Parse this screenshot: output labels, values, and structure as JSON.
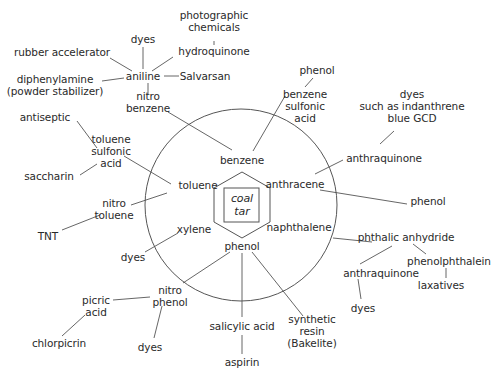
{
  "diagram": {
    "center": {
      "label": "coal\ntar",
      "x": 242,
      "y": 205
    },
    "colors": {
      "line": "#555555",
      "text": "#2a2a2a",
      "background": "#ffffff"
    },
    "nodes": [
      {
        "id": "benzene",
        "label": "benzene",
        "x": 242,
        "y": 160
      },
      {
        "id": "toluene",
        "label": "toluene",
        "x": 198,
        "y": 185
      },
      {
        "id": "anthracene",
        "label": "anthracene",
        "x": 295,
        "y": 184
      },
      {
        "id": "xylene",
        "label": "xylene",
        "x": 194,
        "y": 229
      },
      {
        "id": "naphthalene",
        "label": "naphthalene",
        "x": 299,
        "y": 227
      },
      {
        "id": "phenol_center",
        "label": "phenol",
        "x": 242,
        "y": 246
      },
      {
        "id": "nitrobenzene",
        "label": "nitro\nbenzene",
        "x": 148,
        "y": 102
      },
      {
        "id": "aniline",
        "label": "aniline",
        "x": 143,
        "y": 76
      },
      {
        "id": "dyes_aniline",
        "label": "dyes",
        "x": 143,
        "y": 39
      },
      {
        "id": "rubber_accelerator",
        "label": "rubber accelerator",
        "x": 62,
        "y": 52
      },
      {
        "id": "hydroquinone",
        "label": "hydroquinone",
        "x": 214,
        "y": 51
      },
      {
        "id": "photographic_chemicals",
        "label": "photographic\nchemicals",
        "x": 214,
        "y": 21
      },
      {
        "id": "salvarsan",
        "label": "Salvarsan",
        "x": 205,
        "y": 76
      },
      {
        "id": "diphenylamine",
        "label": "diphenylamine\n(powder stabilizer)",
        "x": 55,
        "y": 85
      },
      {
        "id": "benzene_sulfonic_acid",
        "label": "benzene\nsulfonic\nacid",
        "x": 305,
        "y": 106
      },
      {
        "id": "phenol_top",
        "label": "phenol",
        "x": 317,
        "y": 70
      },
      {
        "id": "dyes_indanthrene",
        "label": "dyes\nsuch as indanthrene\nblue GCD",
        "x": 412,
        "y": 106
      },
      {
        "id": "anthraquinone_top",
        "label": "anthraquinone",
        "x": 384,
        "y": 158
      },
      {
        "id": "phenol_right",
        "label": "phenol",
        "x": 428,
        "y": 201
      },
      {
        "id": "phthalic_anhydride",
        "label": "phthalic anhydride",
        "x": 406,
        "y": 237
      },
      {
        "id": "phenolphthalein",
        "label": "phenolphthalein",
        "x": 449,
        "y": 261
      },
      {
        "id": "laxatives",
        "label": "laxatives",
        "x": 441,
        "y": 285
      },
      {
        "id": "anthraquinone_bottom",
        "label": "anthraquinone",
        "x": 381,
        "y": 273
      },
      {
        "id": "dyes_anthraquinone",
        "label": "dyes",
        "x": 363,
        "y": 308
      },
      {
        "id": "toluene_sulfonic_acid",
        "label": "toluene\nsulfonic\nacid",
        "x": 111,
        "y": 151
      },
      {
        "id": "antiseptic",
        "label": "antiseptic",
        "x": 45,
        "y": 117
      },
      {
        "id": "saccharin",
        "label": "saccharin",
        "x": 49,
        "y": 176
      },
      {
        "id": "nitrotoluene",
        "label": "nitro\ntoluene",
        "x": 114,
        "y": 209
      },
      {
        "id": "tnt",
        "label": "TNT",
        "x": 48,
        "y": 236
      },
      {
        "id": "dyes_xylene",
        "label": "dyes",
        "x": 133,
        "y": 257
      },
      {
        "id": "nitrophenol",
        "label": "nitro\nphenol",
        "x": 170,
        "y": 296
      },
      {
        "id": "picric_acid",
        "label": "picric\nacid",
        "x": 96,
        "y": 306
      },
      {
        "id": "chlorpicrin",
        "label": "chlorpicrin",
        "x": 59,
        "y": 343
      },
      {
        "id": "dyes_nitrophenol",
        "label": "dyes",
        "x": 150,
        "y": 347
      },
      {
        "id": "salicylic_acid",
        "label": "salicylic acid",
        "x": 242,
        "y": 326
      },
      {
        "id": "aspirin",
        "label": "aspirin",
        "x": 242,
        "y": 362
      },
      {
        "id": "synthetic_resin",
        "label": "synthetic\nresin\n(Bakelite)",
        "x": 312,
        "y": 331
      }
    ],
    "edges": [
      [
        "nitrobenzene",
        "benzene"
      ],
      [
        "benzene_sulfonic_acid",
        "benzene"
      ],
      [
        "aniline",
        "nitrobenzene"
      ],
      [
        "aniline",
        "dyes_aniline"
      ],
      [
        "aniline",
        "rubber_accelerator"
      ],
      [
        "aniline",
        "hydroquinone"
      ],
      [
        "aniline",
        "salvarsan"
      ],
      [
        "aniline",
        "diphenylamine"
      ],
      [
        "hydroquinone",
        "photographic_chemicals"
      ],
      [
        "benzene_sulfonic_acid",
        "phenol_top"
      ],
      [
        "anthraquinone_top",
        "dyes_indanthrene"
      ],
      [
        "anthraquinone_top",
        "anthracene"
      ],
      [
        "anthracene",
        "phenol_right"
      ],
      [
        "naphthalene",
        "phthalic_anhydride"
      ],
      [
        "phthalic_anhydride",
        "anthraquinone_bottom"
      ],
      [
        "phthalic_anhydride",
        "phenolphthalein"
      ],
      [
        "phenolphthalein",
        "laxatives"
      ],
      [
        "anthraquinone_bottom",
        "dyes_anthraquinone"
      ],
      [
        "toluene_sulfonic_acid",
        "antiseptic"
      ],
      [
        "toluene_sulfonic_acid",
        "saccharin"
      ],
      [
        "toluene_sulfonic_acid",
        "toluene"
      ],
      [
        "nitrotoluene",
        "toluene"
      ],
      [
        "nitrotoluene",
        "tnt"
      ],
      [
        "xylene",
        "dyes_xylene"
      ],
      [
        "phenol_center",
        "nitrophenol"
      ],
      [
        "phenol_center",
        "salicylic_acid"
      ],
      [
        "phenol_center",
        "synthetic_resin"
      ],
      [
        "nitrophenol",
        "picric_acid"
      ],
      [
        "nitrophenol",
        "dyes_nitrophenol"
      ],
      [
        "picric_acid",
        "chlorpicrin"
      ],
      [
        "salicylic_acid",
        "aspirin"
      ]
    ],
    "line_segments": [
      [
        168,
        112,
        232,
        150
      ],
      [
        285,
        96,
        253,
        151
      ],
      [
        148,
        83,
        148,
        94
      ],
      [
        143,
        69,
        143,
        47
      ],
      [
        132,
        71,
        110,
        58
      ],
      [
        152,
        71,
        173,
        57
      ],
      [
        164,
        76,
        179,
        76
      ],
      [
        124,
        78,
        102,
        81
      ],
      [
        214,
        41,
        214,
        45
      ],
      [
        305,
        87,
        313,
        78
      ],
      [
        380,
        144,
        394,
        131
      ],
      [
        343,
        160,
        315,
        174
      ],
      [
        320,
        190,
        407,
        204
      ],
      [
        333,
        238,
        372,
        242
      ],
      [
        392,
        246,
        360,
        264
      ],
      [
        413,
        244,
        426,
        254
      ],
      [
        446,
        268,
        446,
        278
      ],
      [
        358,
        279,
        361,
        299
      ],
      [
        97,
        148,
        77,
        121
      ],
      [
        97,
        164,
        80,
        175
      ],
      [
        124,
        156,
        171,
        184
      ],
      [
        131,
        205,
        167,
        193
      ],
      [
        100,
        215,
        62,
        230
      ],
      [
        178,
        233,
        145,
        252
      ],
      [
        230,
        252,
        183,
        283
      ],
      [
        242,
        253,
        242,
        317
      ],
      [
        252,
        252,
        303,
        316
      ],
      [
        150,
        297,
        113,
        300
      ],
      [
        162,
        306,
        154,
        338
      ],
      [
        85,
        315,
        62,
        336
      ],
      [
        242,
        335,
        242,
        354
      ]
    ],
    "shapes": {
      "outer_circle": {
        "cx": 241,
        "cy": 205,
        "r": 96
      },
      "hexagon_points": "242,172 270,188 270,222 242,238 214,222 214,188",
      "square": {
        "x": 224,
        "y": 188,
        "w": 35,
        "h": 34
      }
    }
  }
}
